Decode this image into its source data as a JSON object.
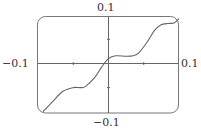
{
  "chart_data": {
    "type": "line",
    "title": "",
    "xlabel": "",
    "ylabel": "",
    "xlim": [
      -0.1,
      0.1
    ],
    "ylim": [
      -0.1,
      0.1
    ],
    "grid": false,
    "legend": null,
    "axis_labels": {
      "top": "0.1",
      "bottom": "−0.1",
      "left": "−0.1",
      "right": "0.1"
    },
    "x_ticks": [
      -0.05,
      0.05
    ],
    "y_ticks": [
      -0.05,
      0.05
    ],
    "series": [
      {
        "name": "f(x)",
        "color": "#555555",
        "x": [
          -0.093,
          -0.08,
          -0.065,
          -0.05,
          -0.04,
          -0.033,
          -0.02,
          -0.01,
          0.0,
          0.01,
          0.025,
          0.035,
          0.043,
          0.055,
          0.065,
          0.074,
          0.085,
          0.093,
          0.1
        ],
        "y": [
          -0.1,
          -0.08,
          -0.058,
          -0.05,
          -0.05,
          -0.048,
          -0.03,
          -0.008,
          0.01,
          0.016,
          0.015,
          0.016,
          0.022,
          0.045,
          0.068,
          0.08,
          0.083,
          0.084,
          0.093
        ]
      }
    ]
  },
  "frame": {
    "stroke": "#555555",
    "axis_color": "#555555"
  }
}
